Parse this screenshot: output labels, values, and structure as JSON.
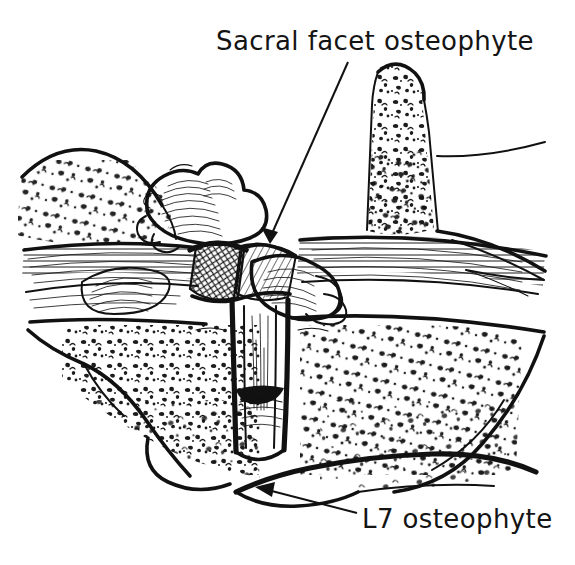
{
  "figure": {
    "type": "line-art-medical-illustration",
    "medium": "pen-and-ink stipple drawing",
    "background_color": "#ffffff",
    "ink_color": "#111111",
    "annotations": [
      {
        "id": "sacral-facet-osteophyte",
        "text": "Sacral facet osteophyte",
        "text_x": 216,
        "text_y": 26,
        "font_size": 26,
        "leader": {
          "from_x": 348,
          "from_y": 60,
          "to_x": 268,
          "to_y": 242,
          "has_arrowhead": true,
          "arrow_direction": "down-left"
        }
      },
      {
        "id": "l7-osteophyte",
        "text": "L7 osteophyte",
        "text_x": 362,
        "text_y": 504,
        "font_size": 26,
        "leader": {
          "from_x": 357,
          "from_y": 513,
          "to_x": 256,
          "to_y": 492,
          "has_arrowhead": true,
          "arrow_direction": "up-left"
        }
      }
    ],
    "structures": [
      {
        "name": "sacral-spinous-process",
        "region": "upper-right",
        "shading": "trabecular-stipple"
      },
      {
        "name": "sacral-ala-upper-left",
        "region": "upper-left",
        "shading": "trabecular-stipple"
      },
      {
        "name": "interspinous-ligament-band",
        "region": "upper-middle",
        "shading": "horizontal-line-hatch"
      },
      {
        "name": "superior-articular-process",
        "region": "center-left",
        "shading": "curved-line-hatch"
      },
      {
        "name": "facet-joint-cartilage",
        "region": "center",
        "shading": "cross-hatch-diamond"
      },
      {
        "name": "articular-pillar",
        "region": "center-lower",
        "shading": "vertical-hatch"
      },
      {
        "name": "l7-vertebral-body",
        "region": "lower",
        "shading": "trabecular-stipple"
      },
      {
        "name": "l7-ventral-osteophyte",
        "region": "lower-center",
        "shading": "bold-contour"
      },
      {
        "name": "intervertebral-disc-space",
        "region": "center-right",
        "shading": "horizontal-line-hatch"
      }
    ]
  }
}
